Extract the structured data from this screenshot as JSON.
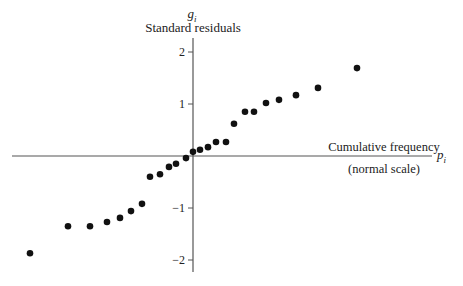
{
  "chart_data": {
    "type": "scatter",
    "title": "",
    "y_symbol": "g",
    "y_symbol_subscript": "i",
    "ylabel": "Standard residuals",
    "x_symbol": "p",
    "x_symbol_subscript": "i",
    "xlabel": "Cumulative frequency",
    "xlabel_sub": "(normal scale)",
    "ylim": [
      -2.2,
      2.3
    ],
    "yticks": [
      2,
      1,
      -1,
      -2
    ],
    "ytick_labels": [
      "2",
      "1",
      "−1",
      "−2"
    ],
    "grid": false,
    "legend": null,
    "point_color": "#111111",
    "axis_color": "#555555",
    "series": [
      {
        "name": "residuals",
        "x_px": [
          30,
          68,
          90,
          107,
          120,
          131,
          142,
          150,
          160,
          169,
          176,
          186,
          193,
          200,
          208,
          216,
          226,
          234,
          245,
          254,
          266,
          279,
          296,
          318,
          357
        ],
        "values": [
          -1.87,
          -1.35,
          -1.35,
          -1.27,
          -1.19,
          -1.06,
          -0.92,
          -0.4,
          -0.35,
          -0.21,
          -0.15,
          -0.04,
          0.08,
          0.12,
          0.17,
          0.27,
          0.27,
          0.62,
          0.85,
          0.85,
          1.02,
          1.08,
          1.17,
          1.31,
          1.69
        ]
      }
    ]
  }
}
